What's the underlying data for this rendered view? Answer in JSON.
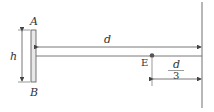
{
  "diagram": {
    "labels": {
      "top_end": "A",
      "bottom_end": "B",
      "height": "h",
      "distance": "d",
      "point": "E",
      "fraction_num": "d",
      "fraction_den": "3"
    },
    "colors": {
      "line": "#555555",
      "plate_fill": "#e8e8e8",
      "wall": "#888888"
    }
  }
}
